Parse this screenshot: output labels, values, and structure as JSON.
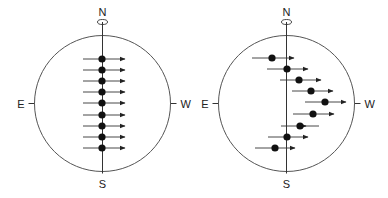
{
  "colors": {
    "stroke": "#333333",
    "circle": "#555555",
    "dot": "#111111",
    "text": "#222222"
  },
  "diagrams": [
    {
      "name": "uniform-rotation",
      "center": [
        102.5,
        103.5
      ],
      "radius": 68,
      "labels": {
        "north": "N",
        "south": "S",
        "east": "E",
        "west": "W"
      },
      "rows": [
        {
          "y": 59,
          "dot_x": 102,
          "x1": 83,
          "x2": 125
        },
        {
          "y": 70,
          "dot_x": 102,
          "x1": 83,
          "x2": 125
        },
        {
          "y": 81,
          "dot_x": 102,
          "x1": 83,
          "x2": 125
        },
        {
          "y": 92,
          "dot_x": 102,
          "x1": 83,
          "x2": 125
        },
        {
          "y": 103,
          "dot_x": 102,
          "x1": 83,
          "x2": 125
        },
        {
          "y": 115,
          "dot_x": 102,
          "x1": 83,
          "x2": 125
        },
        {
          "y": 126,
          "dot_x": 102,
          "x1": 83,
          "x2": 125
        },
        {
          "y": 137,
          "dot_x": 102,
          "x1": 83,
          "x2": 125
        },
        {
          "y": 148,
          "dot_x": 102,
          "x1": 83,
          "x2": 125
        }
      ]
    },
    {
      "name": "differential-rotation",
      "center": [
        286.5,
        103.5
      ],
      "radius": 68,
      "labels": {
        "north": "N",
        "south": "S",
        "east": "E",
        "west": "W"
      },
      "rows": [
        {
          "y": 58,
          "dot_x": 272,
          "x1": 252,
          "x2": 294
        },
        {
          "y": 69,
          "dot_x": 287,
          "x1": 267,
          "x2": 308
        },
        {
          "y": 80,
          "dot_x": 299,
          "x1": 280,
          "x2": 321
        },
        {
          "y": 91,
          "dot_x": 311,
          "x1": 292,
          "x2": 333
        },
        {
          "y": 102,
          "dot_x": 325,
          "x1": 305,
          "x2": 346
        },
        {
          "y": 114,
          "dot_x": 313,
          "x1": 293,
          "x2": 334
        },
        {
          "y": 126,
          "dot_x": 300,
          "x1": 281,
          "x2": 319,
          "head_x": 306
        },
        {
          "y": 137,
          "dot_x": 287,
          "x1": 268,
          "x2": 308
        },
        {
          "y": 148,
          "dot_x": 275,
          "x1": 255,
          "x2": 295
        }
      ]
    }
  ]
}
